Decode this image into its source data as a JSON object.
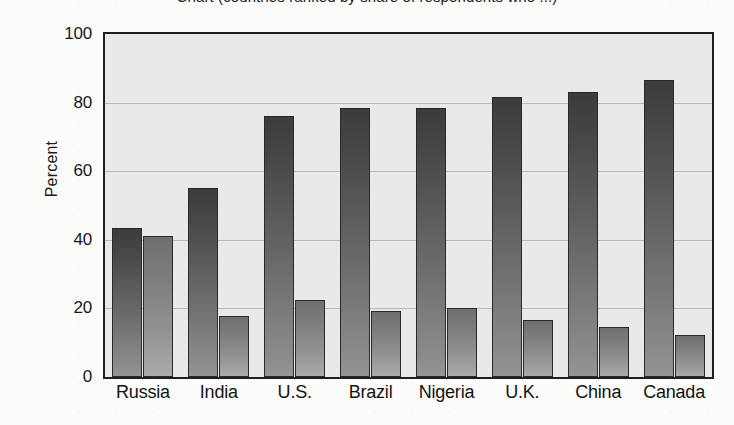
{
  "figure": {
    "title_clipped": "Chart (countries ranked by share of respondents who ...)",
    "plot_background": "#e9e9e7",
    "series_colors": [
      "#4a4a4a",
      "#8f8f8f"
    ]
  },
  "chart_data": {
    "type": "bar",
    "title": "",
    "xlabel": "",
    "ylabel": "Percent",
    "ylim": [
      0,
      100
    ],
    "yticks": [
      0,
      20,
      40,
      60,
      80,
      100
    ],
    "grid": true,
    "legend": "none",
    "categories": [
      "Russia",
      "India",
      "U.S.",
      "Brazil",
      "Nigeria",
      "U.K.",
      "China",
      "Canada"
    ],
    "series": [
      {
        "name": "Series 1",
        "color": "#4a4a4a",
        "values": [
          43.5,
          55.2,
          76.2,
          78.5,
          78.5,
          81.6,
          83.1,
          86.6
        ]
      },
      {
        "name": "Series 2",
        "color": "#8f8f8f",
        "values": [
          41.0,
          17.7,
          22.5,
          19.2,
          20.1,
          16.7,
          14.7,
          12.2
        ]
      }
    ]
  }
}
